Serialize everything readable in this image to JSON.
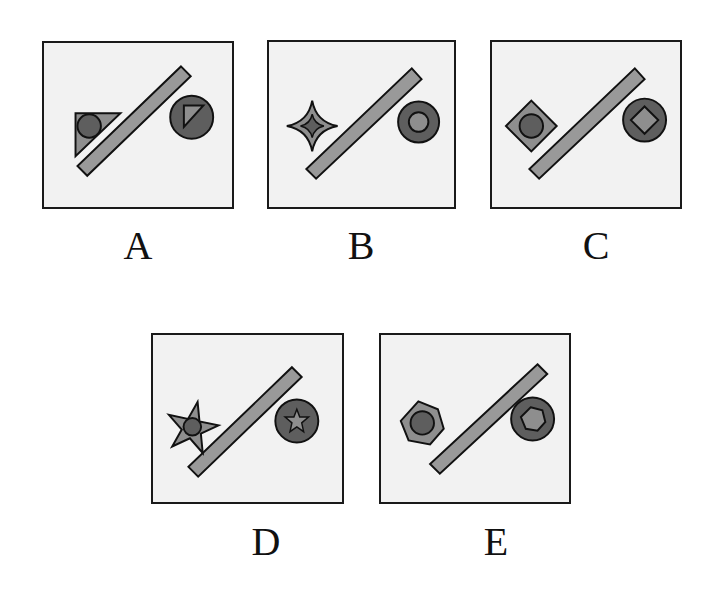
{
  "figure": {
    "type": "visual-analogy-puzzle",
    "colors": {
      "panel_fill": "#f2f2f2",
      "border": "#1a1a1a",
      "light_shape": "#8e8e8e",
      "dark_shape": "#5e5e5e",
      "bar": "#999999"
    }
  },
  "options": [
    {
      "label": "A",
      "left": {
        "outer": "right-triangle",
        "outer_color": "light",
        "inner": "circle",
        "inner_color": "dark"
      },
      "right": {
        "outer": "circle",
        "outer_color": "dark",
        "inner": "right-triangle",
        "inner_color": "light"
      }
    },
    {
      "label": "B",
      "left": {
        "outer": "four-point-star",
        "outer_color": "light",
        "inner": "four-point-star",
        "inner_color": "dark"
      },
      "right": {
        "outer": "circle",
        "outer_color": "dark",
        "inner": "circle",
        "inner_color": "light"
      }
    },
    {
      "label": "C",
      "left": {
        "outer": "diamond",
        "outer_color": "light",
        "inner": "circle",
        "inner_color": "dark"
      },
      "right": {
        "outer": "circle",
        "outer_color": "dark",
        "inner": "diamond",
        "inner_color": "light"
      }
    },
    {
      "label": "D",
      "left": {
        "outer": "five-point-star",
        "outer_color": "light",
        "inner": "circle",
        "inner_color": "dark"
      },
      "right": {
        "outer": "circle",
        "outer_color": "dark",
        "inner": "five-point-star",
        "inner_color": "light"
      }
    },
    {
      "label": "E",
      "left": {
        "outer": "hexagon",
        "outer_color": "light",
        "inner": "circle",
        "inner_color": "dark"
      },
      "right": {
        "outer": "circle",
        "outer_color": "dark",
        "inner": "hexagon",
        "inner_color": "light"
      }
    }
  ]
}
